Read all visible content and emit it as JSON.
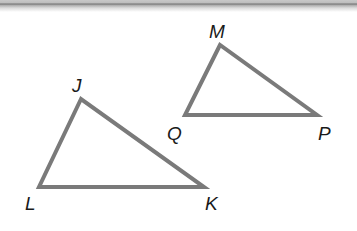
{
  "figure": {
    "stroke_color": "#7a7a7a",
    "triangles": [
      {
        "name": "JLK",
        "vertices": {
          "J": {
            "x": 81,
            "y": 99,
            "label": "J"
          },
          "L": {
            "x": 39,
            "y": 187,
            "label": "L"
          },
          "K": {
            "x": 204,
            "y": 187,
            "label": "K"
          }
        }
      },
      {
        "name": "MQP",
        "vertices": {
          "M": {
            "x": 220,
            "y": 45,
            "label": "M"
          },
          "Q": {
            "x": 185,
            "y": 115,
            "label": "Q"
          },
          "P": {
            "x": 317,
            "y": 115,
            "label": "P"
          }
        }
      }
    ]
  },
  "labels": {
    "J": "J",
    "L": "L",
    "K": "K",
    "M": "M",
    "Q": "Q",
    "P": "P"
  }
}
